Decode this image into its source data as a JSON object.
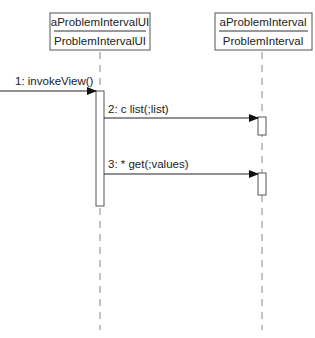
{
  "diagram": {
    "type": "uml-sequence",
    "lifelines": [
      {
        "instance": "aProblemIntervalUI",
        "class": "ProblemIntervalUI"
      },
      {
        "instance": "aProblemInterval",
        "class": "ProblemInterval"
      }
    ],
    "messages": [
      {
        "label": "1: invokeView()",
        "from": "external",
        "to": "aProblemIntervalUI"
      },
      {
        "label": "2: c list(;list)",
        "from": "aProblemIntervalUI",
        "to": "aProblemInterval"
      },
      {
        "label": "3: * get(;values)",
        "from": "aProblemIntervalUI",
        "to": "aProblemInterval"
      }
    ],
    "colors": {
      "line": "#333333",
      "lifeline": "#888888",
      "background": "#ffffff"
    }
  }
}
